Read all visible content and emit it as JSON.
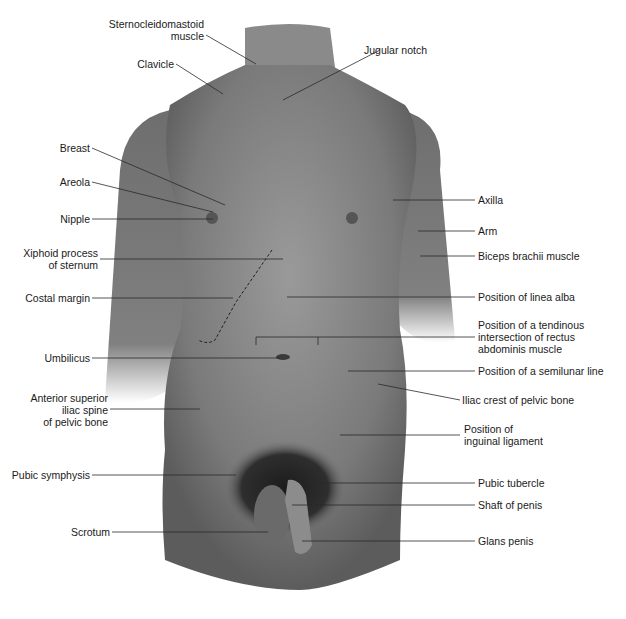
{
  "figure": {
    "labels_left": [
      {
        "id": "sternocleidomastoid",
        "text": "Sternocleidomastoid\nmuscle"
      },
      {
        "id": "clavicle",
        "text": "Clavicle"
      },
      {
        "id": "breast",
        "text": "Breast"
      },
      {
        "id": "areola",
        "text": "Areola"
      },
      {
        "id": "nipple",
        "text": "Nipple"
      },
      {
        "id": "xiphoid",
        "text": "Xiphoid process\nof sternum"
      },
      {
        "id": "costal-margin",
        "text": "Costal margin"
      },
      {
        "id": "umbilicus",
        "text": "Umbilicus"
      },
      {
        "id": "asis",
        "text": "Anterior superior\niliac spine\nof pelvic bone"
      },
      {
        "id": "pubic-symphysis",
        "text": "Pubic symphysis"
      },
      {
        "id": "scrotum",
        "text": "Scrotum"
      }
    ],
    "labels_right": [
      {
        "id": "jugular-notch",
        "text": "Jugular notch"
      },
      {
        "id": "axilla",
        "text": "Axilla"
      },
      {
        "id": "arm",
        "text": "Arm"
      },
      {
        "id": "biceps",
        "text": "Biceps brachii muscle"
      },
      {
        "id": "linea-alba",
        "text": "Position of linea alba"
      },
      {
        "id": "tendinous-intersection",
        "text": "Position of a tendinous\nintersection of rectus\nabdominis muscle"
      },
      {
        "id": "semilunar-line",
        "text": "Position of a semilunar line"
      },
      {
        "id": "iliac-crest",
        "text": "Iliac crest of pelvic bone"
      },
      {
        "id": "inguinal-ligament",
        "text": "Position of\ninguinal ligament"
      },
      {
        "id": "pubic-tubercle",
        "text": "Pubic tubercle"
      },
      {
        "id": "shaft-penis",
        "text": "Shaft of penis"
      },
      {
        "id": "glans-penis",
        "text": "Glans penis"
      }
    ]
  }
}
